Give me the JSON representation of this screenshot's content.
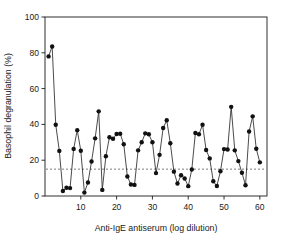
{
  "chart_data": {
    "type": "line",
    "title": "",
    "subtitle": "",
    "xlabel": "Anti-IgE antiserum (log dilution)",
    "ylabel": "Basophil degranulation (%)",
    "xlim": [
      0,
      62
    ],
    "ylim": [
      0,
      100
    ],
    "xticks": [
      10,
      20,
      30,
      40,
      50,
      60
    ],
    "yticks": [
      0,
      20,
      40,
      60,
      80,
      100
    ],
    "xtick_labels": [
      "10",
      "20",
      "30",
      "40",
      "50",
      "60"
    ],
    "ytick_labels": [
      "0",
      "20",
      "40",
      "60",
      "80",
      "100"
    ],
    "grid": false,
    "legend": false,
    "legend_position": "none",
    "marker": "filled-circle",
    "marker_size": 2.2,
    "line_color": "#2b2b2b",
    "marker_color": "#111111",
    "annotations": [
      {
        "name": "baseline-reference",
        "type": "hline",
        "value": 15,
        "style": "dashed",
        "color": "#5a5a5a"
      }
    ],
    "series": [
      {
        "name": "Basophil degranulation",
        "x": [
          1,
          2,
          3,
          4,
          5,
          6,
          7,
          8,
          9,
          10,
          11,
          12,
          13,
          14,
          15,
          16,
          17,
          18,
          19,
          20,
          21,
          22,
          23,
          24,
          25,
          26,
          27,
          28,
          29,
          30,
          31,
          32,
          33,
          34,
          35,
          36,
          37,
          38,
          39,
          40,
          41,
          42,
          43,
          44,
          45,
          46,
          47,
          48,
          49,
          50,
          51,
          52,
          53,
          54,
          55,
          56,
          57,
          58,
          59,
          60
        ],
        "values": [
          78.0,
          83.5,
          39.8,
          25.2,
          2.8,
          4.6,
          4.4,
          26.3,
          36.8,
          25.3,
          1.9,
          7.5,
          19.3,
          32.2,
          47.3,
          3.4,
          22.2,
          32.8,
          32.0,
          34.6,
          34.8,
          28.9,
          10.9,
          6.4,
          6.2,
          25.5,
          30.0,
          35.0,
          34.5,
          30.0,
          12.8,
          23.0,
          38.0,
          42.3,
          29.5,
          13.6,
          7.0,
          11.6,
          9.8,
          5.5,
          14.8,
          35.2,
          34.5,
          39.8,
          25.7,
          21.0,
          8.2,
          5.6,
          13.8,
          26.2,
          26.0,
          49.8,
          25.5,
          19.5,
          13.0,
          6.0,
          36.0,
          44.5,
          26.4,
          18.8
        ]
      }
    ]
  }
}
